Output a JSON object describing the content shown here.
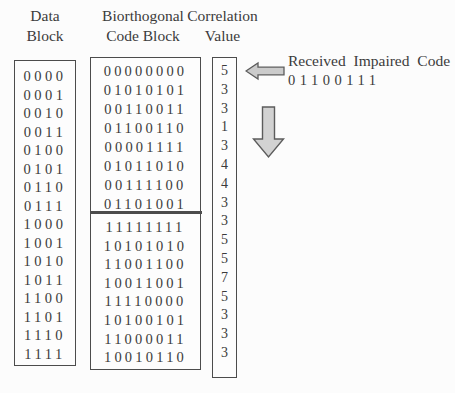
{
  "columns": {
    "data_block": {
      "header_line1": "Data",
      "header_line2": "Block",
      "rows": [
        "0000",
        "0001",
        "0010",
        "0011",
        "0100",
        "0101",
        "0110",
        "0111",
        "1000",
        "1001",
        "1010",
        "1011",
        "1100",
        "1101",
        "1110",
        "1111"
      ]
    },
    "code_block": {
      "header_line1": "Biorthogonal",
      "header_line2": "Code Block",
      "top_rows": [
        "00000000",
        "01010101",
        "00110011",
        "01100110",
        "00001111",
        "01011010",
        "00111100",
        "01101001"
      ],
      "bottom_rows": [
        "11111111",
        "10101010",
        "11001100",
        "10011001",
        "11110000",
        "10100101",
        "11000011",
        "10010110"
      ]
    },
    "correlation": {
      "header_line1": "Correlation",
      "header_line2": "Value",
      "values": [
        "5",
        "3",
        "3",
        "1",
        "3",
        "4",
        "4",
        "3",
        "3",
        "5",
        "5",
        "7",
        "5",
        "3",
        "3",
        "3"
      ]
    }
  },
  "received": {
    "label": "Received Impaired Code",
    "code": "01100111"
  },
  "icons": {
    "left_arrow": "left-block-arrow-icon",
    "down_arrow": "down-block-arrow-icon"
  },
  "colors": {
    "text": "#3b3b3b",
    "box_border": "#4c4c4c",
    "arrow_fill": "#cbcbcb",
    "arrow_outline": "#5c5c5c",
    "background": "#fcfcfc"
  }
}
